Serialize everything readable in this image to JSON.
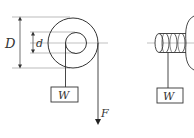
{
  "diagram": {
    "left_figure": {
      "labels": {
        "outer_diameter": "D",
        "inner_diameter": "d",
        "weight": "W",
        "force": "F"
      }
    },
    "right_figure": {
      "labels": {
        "weight": "W"
      }
    },
    "colors": {
      "stroke": "#333333",
      "centerline": "#999999",
      "background": "#ffffff"
    }
  }
}
